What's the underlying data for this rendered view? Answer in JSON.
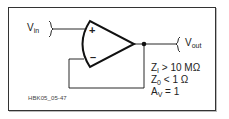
{
  "diagram": {
    "figure_id": "HBK05_05-47",
    "labels": {
      "vin": {
        "main": "V",
        "sub": "in"
      },
      "vout": {
        "main": "V",
        "sub": "out"
      }
    },
    "opamp": {
      "plus": "+",
      "minus": "–"
    },
    "specs": [
      {
        "main": "Z",
        "sub": "I",
        "rest": " > 10 MΩ"
      },
      {
        "main": "Z",
        "sub": "0",
        "rest": " < 1 Ω"
      },
      {
        "main": "A",
        "sub": "V",
        "rest": " = 1"
      }
    ],
    "colors": {
      "line": "#111111",
      "text": "#222222",
      "frame": "#333333"
    }
  }
}
